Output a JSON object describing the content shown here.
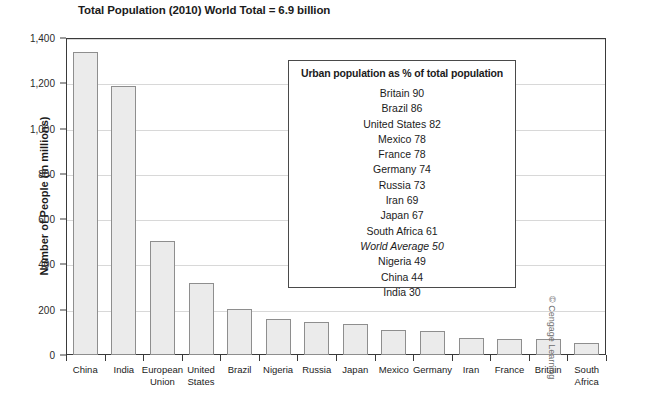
{
  "chart_data": {
    "type": "bar",
    "title": "Total Population (2010) World Total = 6.9 billion",
    "xlabel": "",
    "ylabel": "Number of People (in millions)",
    "ylim": [
      0,
      1400
    ],
    "yticks": [
      0,
      200,
      400,
      600,
      800,
      1000,
      1200,
      1400
    ],
    "ytick_labels": [
      "0",
      "200",
      "400",
      "600",
      "800",
      "1,000",
      "1,200",
      "1,400"
    ],
    "grid": true,
    "legend": "none",
    "categories": [
      "China",
      "India",
      "European Union",
      "United States",
      "Brazil",
      "Nigeria",
      "Russia",
      "Japan",
      "Mexico",
      "Germany",
      "Iran",
      "France",
      "Britain",
      "South Africa"
    ],
    "values": [
      1340,
      1190,
      503,
      320,
      205,
      160,
      147,
      137,
      112,
      106,
      74,
      72,
      70,
      55
    ],
    "bar_fill": "#ebebeb",
    "bar_border": "#8e8e8e"
  },
  "inset": {
    "title": "Urban population as % of total population",
    "rows": [
      {
        "label": "Britain 90",
        "italic": false
      },
      {
        "label": "Brazil 86",
        "italic": false
      },
      {
        "label": "United States 82",
        "italic": false
      },
      {
        "label": "Mexico 78",
        "italic": false
      },
      {
        "label": "France 78",
        "italic": false
      },
      {
        "label": "Germany 74",
        "italic": false
      },
      {
        "label": "Russia 73",
        "italic": false
      },
      {
        "label": "Iran 69",
        "italic": false
      },
      {
        "label": "Japan 67",
        "italic": false
      },
      {
        "label": "South Africa 61",
        "italic": false
      },
      {
        "label": "World Average 50",
        "italic": true
      },
      {
        "label": "Nigeria 49",
        "italic": false
      },
      {
        "label": "China 44",
        "italic": false
      },
      {
        "label": "India 30",
        "italic": false
      }
    ]
  },
  "credit": "© Cengage Learning"
}
